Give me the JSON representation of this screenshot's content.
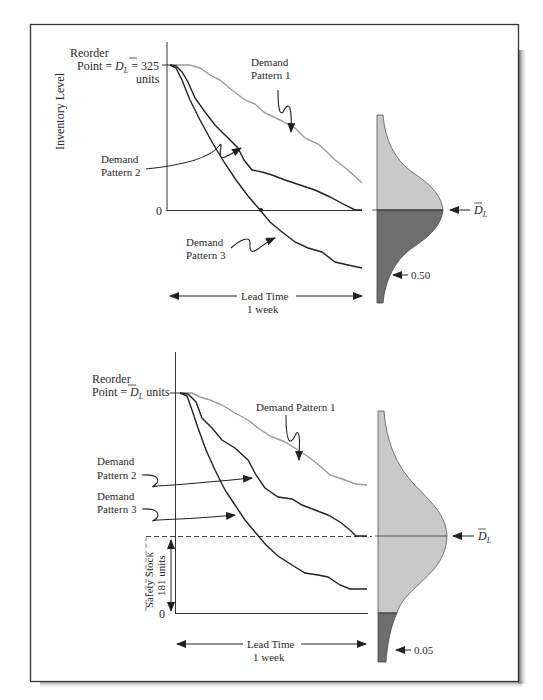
{
  "figure": {
    "top_panel": {
      "y_axis_label": "Inventory Level",
      "reorder_label_line1": "Reorder",
      "reorder_label_line2_prefix": "Point = ",
      "reorder_symbol": "D",
      "reorder_symbol_sub": "L",
      "reorder_value": " = 325",
      "reorder_units": "units",
      "zero_tick": "0",
      "demand_pattern_1": [
        "Demand",
        "Pattern 1"
      ],
      "demand_pattern_2": [
        "Demand",
        "Pattern 2"
      ],
      "demand_pattern_3": [
        "Demand",
        "Pattern 3"
      ],
      "lead_time_label": "Lead Time",
      "lead_time_value": "1 week",
      "mean_label_symbol": "D",
      "mean_label_sub": "L",
      "probability_label": "0.50",
      "colors": {
        "pattern1": "#9a9a9a",
        "pattern2": "#222222",
        "pattern3": "#222222",
        "dist_light": "#c9c9c9",
        "dist_dark": "#6e6e6e"
      }
    },
    "bottom_panel": {
      "reorder_label_line1": "Reorder",
      "reorder_label_line2_prefix": "Point = ",
      "reorder_symbol": "D",
      "reorder_symbol_sub": "L",
      "reorder_units": " units",
      "zero_tick": "0",
      "demand_pattern_1": "Demand Pattern 1",
      "demand_pattern_2": [
        "Demand",
        "Pattern 2"
      ],
      "demand_pattern_3": [
        "Demand",
        "Pattern 3"
      ],
      "safety_stock_label": "Safety Stock",
      "safety_stock_value": "181 units",
      "lead_time_label": "Lead Time",
      "lead_time_value": "1 week",
      "mean_label_symbol": "D",
      "mean_label_sub": "L",
      "probability_label": "0.05",
      "colors": {
        "pattern1": "#9a9a9a",
        "pattern2": "#222222",
        "pattern3": "#222222",
        "dist_light": "#c9c9c9",
        "dist_dark": "#6e6e6e"
      }
    }
  }
}
